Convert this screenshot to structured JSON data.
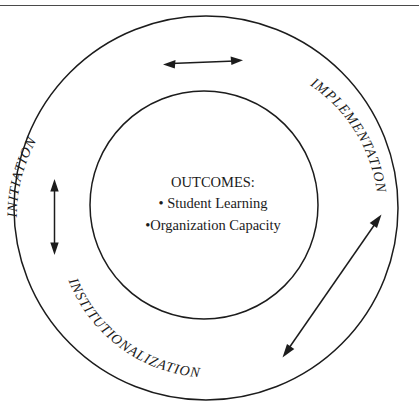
{
  "figure": {
    "background_color": "#ffffff",
    "line_color": "#1c1c1c",
    "rule_color": "#4a4a4a"
  },
  "top_rule": {
    "name": "horizontal-divider"
  },
  "circles": {
    "outer": {
      "label": "outer-ring",
      "cx": 206,
      "cy": 208,
      "r": 192
    },
    "inner": {
      "label": "inner-ring",
      "cx": 204,
      "cy": 205,
      "r": 114
    }
  },
  "ring_labels": [
    {
      "id": "initiation",
      "text": "INITIATION",
      "position": "upper-left"
    },
    {
      "id": "implementation",
      "text": "IMPLEMENTATION",
      "position": "upper-right"
    },
    {
      "id": "institutionalization",
      "text": "INSTITUTIONALIZATION",
      "position": "lower-left"
    }
  ],
  "center": {
    "heading": "OUTCOMES:",
    "items": [
      "• Student Learning",
      "•Organization Capacity"
    ]
  },
  "arrows": [
    {
      "id": "top-arrow",
      "orientation": "horizontal",
      "heads": "both",
      "between": "INITIATION and IMPLEMENTATION"
    },
    {
      "id": "left-arrow",
      "orientation": "vertical",
      "heads": "both",
      "between": "INITIATION and INSTITUTIONALIZATION"
    },
    {
      "id": "diagonal-arrow",
      "orientation": "diagonal",
      "heads": "both",
      "between": "INSTITUTIONALIZATION and IMPLEMENTATION"
    }
  ]
}
